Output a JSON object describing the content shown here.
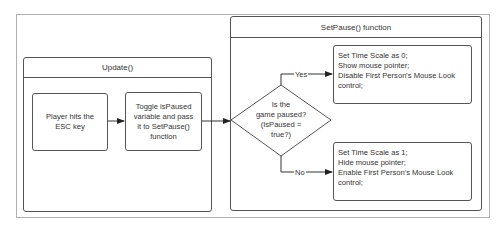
{
  "diagram": {
    "update_panel": {
      "title": "Update()",
      "nodes": [
        {
          "id": "player_hits_esc",
          "lines": [
            "Player hits the",
            "ESC key"
          ]
        },
        {
          "id": "toggle_is_paused",
          "lines": [
            "Toggle isPaused",
            "variable and pass",
            "it to SetPause()",
            "function"
          ]
        }
      ]
    },
    "setpause_panel": {
      "title": "SetPause() function",
      "decision": {
        "lines": [
          "Is the",
          "game paused?",
          "(IsPaused =",
          "true?)"
        ]
      },
      "yes_label": "Yes",
      "no_label": "No",
      "yes_node": {
        "lines": [
          "Set Time Scale as 0;",
          "Show mouse pointer;",
          "Disable First Person's Mouse Look",
          "control;"
        ]
      },
      "no_node": {
        "lines": [
          "Set Time Scale as 1;",
          "Hide mouse pointer;",
          "Enable First Person's Mouse Look",
          "control;"
        ]
      }
    },
    "edges": [
      {
        "from": "Player hits the ESC key",
        "to": "Toggle isPaused variable and pass it to SetPause() function"
      },
      {
        "from": "Toggle isPaused variable and pass it to SetPause() function",
        "to": "Is the game paused?"
      },
      {
        "from": "Is the game paused?",
        "to": "Set Time Scale as 0",
        "label": "Yes"
      },
      {
        "from": "Is the game paused?",
        "to": "Set Time Scale as 1",
        "label": "No"
      }
    ],
    "colors": {
      "stroke": "#555555",
      "outer_frame": "#b0b0b0",
      "text": "#333333",
      "background": "#ffffff"
    }
  }
}
